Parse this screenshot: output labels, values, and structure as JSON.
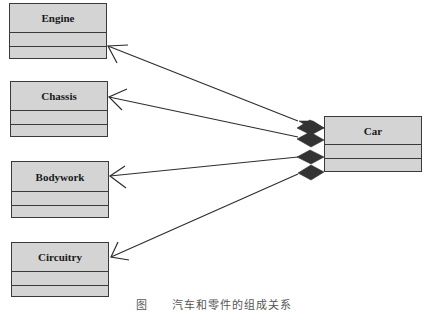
{
  "diagram": {
    "type": "uml-class-composition",
    "whole": {
      "name": "Car"
    },
    "parts": [
      {
        "name": "Engine"
      },
      {
        "name": "Chassis"
      },
      {
        "name": "Bodywork"
      },
      {
        "name": "Circuitry"
      }
    ],
    "relationships": [
      {
        "from": "Car",
        "to": "Engine",
        "kind": "composition"
      },
      {
        "from": "Car",
        "to": "Chassis",
        "kind": "composition"
      },
      {
        "from": "Car",
        "to": "Bodywork",
        "kind": "composition"
      },
      {
        "from": "Car",
        "to": "Circuitry",
        "kind": "composition"
      }
    ],
    "colors": {
      "box_fill": "#d4d4d4",
      "stroke": "#3a3a3a",
      "diamond": "#333333"
    }
  },
  "caption": "图　　汽车和零件的组成关系"
}
